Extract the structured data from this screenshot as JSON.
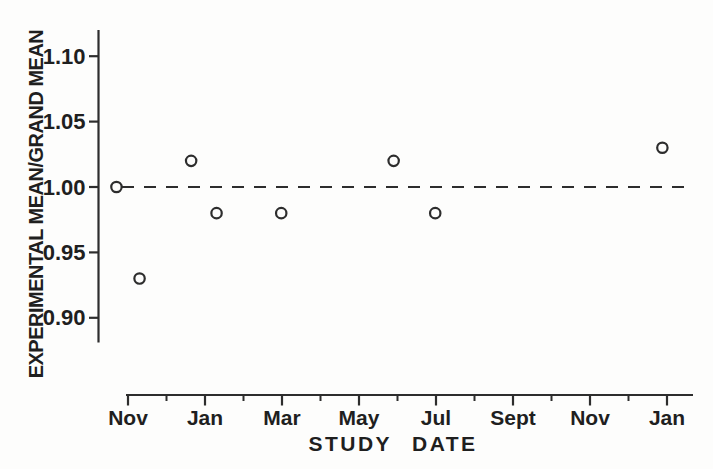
{
  "chart_data": {
    "type": "scatter",
    "title": "",
    "ylabel": "EXPERIMENTAL MEAN/GRAND MEAN",
    "xlabel": "STUDY DATE",
    "background_color": "#fdfdfc",
    "ink_color": "#2d2d2d",
    "text_color": "#1f1f1f",
    "grid": "off",
    "legend": "none",
    "marker": "open-circle",
    "y_axis": {
      "ticks": [
        {
          "value": 1.1,
          "label": "1.10"
        },
        {
          "value": 1.05,
          "label": "1.05"
        },
        {
          "value": 1.0,
          "label": "1.00"
        },
        {
          "value": 0.95,
          "label": "0.95"
        },
        {
          "value": 0.9,
          "label": "0.90"
        }
      ],
      "range_shown": [
        0.878,
        1.121
      ]
    },
    "x_axis": {
      "unit": "months from first Nov tick",
      "major_ticks": [
        {
          "pos": 0,
          "label": "Nov"
        },
        {
          "pos": 2,
          "label": "Jan"
        },
        {
          "pos": 4,
          "label": "Mar"
        },
        {
          "pos": 6,
          "label": "May"
        },
        {
          "pos": 8,
          "label": "Jul"
        },
        {
          "pos": 10,
          "label": "Sept"
        },
        {
          "pos": 12,
          "label": "Nov"
        },
        {
          "pos": 14,
          "label": "Jan"
        }
      ],
      "minor_tick_positions": [
        1,
        3,
        5,
        7,
        9,
        11,
        13
      ]
    },
    "reference_line": {
      "value": 1.0,
      "style": "dashed"
    },
    "points": [
      {
        "x": -0.3,
        "y": 1.0
      },
      {
        "x": 0.3,
        "y": 0.93
      },
      {
        "x": 1.64,
        "y": 1.02
      },
      {
        "x": 2.3,
        "y": 0.98
      },
      {
        "x": 3.98,
        "y": 0.98
      },
      {
        "x": 6.9,
        "y": 1.02
      },
      {
        "x": 7.98,
        "y": 0.98
      },
      {
        "x": 13.88,
        "y": 1.03
      }
    ]
  }
}
